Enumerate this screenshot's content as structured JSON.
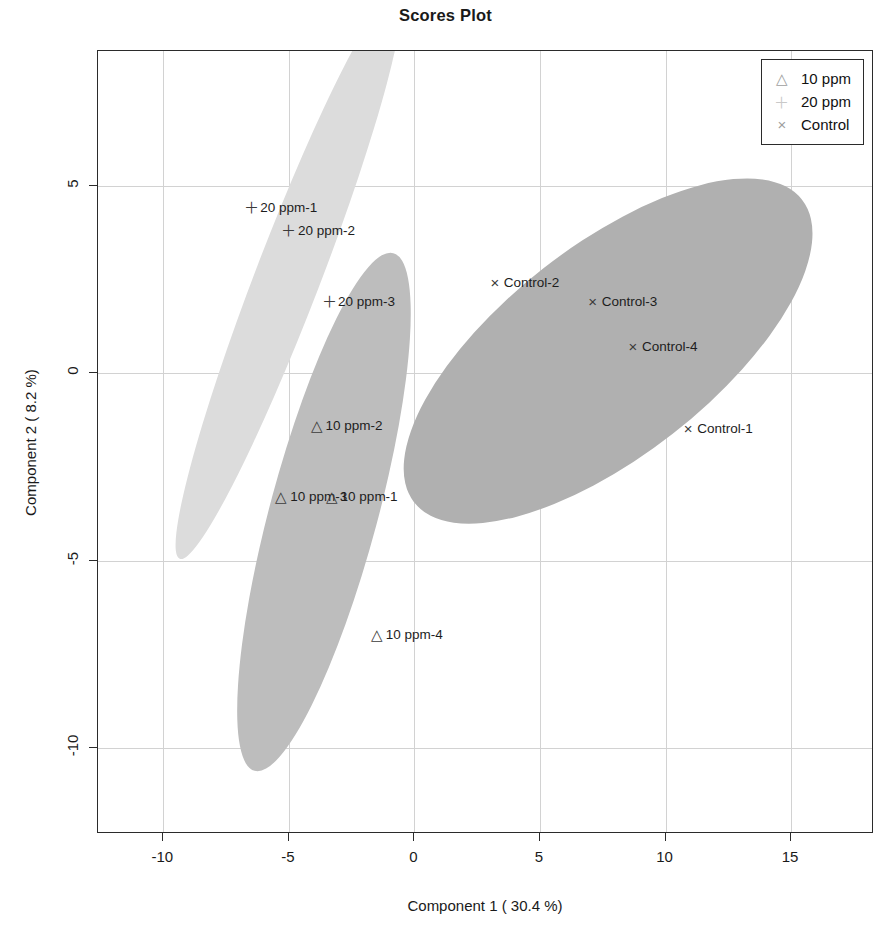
{
  "chart_data": {
    "type": "scatter",
    "title": "Scores Plot",
    "xlabel": "Component 1 ( 30.4 %)",
    "ylabel": "Component 2 ( 8.2 %)",
    "xlim": [
      -12.6,
      18.3
    ],
    "ylim": [
      -12.3,
      8.6
    ],
    "xticks": [
      -10,
      -5,
      0,
      5,
      10,
      15
    ],
    "xticklabels": [
      "-10",
      "-5",
      "0",
      "5",
      "10",
      "15"
    ],
    "yticks": [
      5,
      0,
      -5,
      -10
    ],
    "yticklabels": [
      "5",
      "0",
      "-5",
      "-10"
    ],
    "grid": true,
    "legend_position": "top-right",
    "legend": [
      {
        "label": "10 ppm",
        "marker": "triangle-up-icon",
        "glyph": "△",
        "color": "#9e9e9e"
      },
      {
        "label": "20 ppm",
        "marker": "plus-icon",
        "glyph": "＋",
        "color": "#c9c9c9"
      },
      {
        "label": "Control",
        "marker": "cross-icon",
        "glyph": "×",
        "color": "#9e9e9e"
      }
    ],
    "series": [
      {
        "name": "20 ppm",
        "marker": "plus-icon",
        "glyph": "＋",
        "fill": "#dcdcdc",
        "points": [
          {
            "label": "20 ppm-1",
            "x": -6.5,
            "y": 4.4
          },
          {
            "label": "20 ppm-2",
            "x": -5.0,
            "y": 3.8
          },
          {
            "label": "20 ppm-3",
            "x": -3.4,
            "y": 1.9
          }
        ],
        "ellipse": {
          "cx": -5.0,
          "cy": 2.6,
          "width": 2.6,
          "height": 16.2,
          "angle": 21
        }
      },
      {
        "name": "10 ppm",
        "marker": "triangle-up-icon",
        "glyph": "△",
        "fill": "#bdbdbd",
        "points": [
          {
            "label": "10 ppm-2",
            "x": -3.9,
            "y": -1.4
          },
          {
            "label": "10 ppm-3",
            "x": -5.3,
            "y": -3.3
          },
          {
            "label": "10 ppm-1",
            "x": -3.3,
            "y": -3.3
          },
          {
            "label": "10 ppm-4",
            "x": -1.5,
            "y": -7.0
          }
        ],
        "ellipse": {
          "cx": -3.6,
          "cy": -3.7,
          "width": 4.3,
          "height": 14.3,
          "angle": 15
        }
      },
      {
        "name": "Control",
        "marker": "cross-icon",
        "glyph": "×",
        "fill": "#b0b0b0",
        "points": [
          {
            "label": "Control-2",
            "x": 3.2,
            "y": 2.4
          },
          {
            "label": "Control-3",
            "x": 7.1,
            "y": 1.9
          },
          {
            "label": "Control-4",
            "x": 8.7,
            "y": 0.7
          },
          {
            "label": "Control-1",
            "x": 10.9,
            "y": -1.5
          }
        ],
        "ellipse": {
          "cx": 7.7,
          "cy": 0.6,
          "width": 19.6,
          "height": 5.6,
          "angle": -38
        }
      }
    ]
  }
}
